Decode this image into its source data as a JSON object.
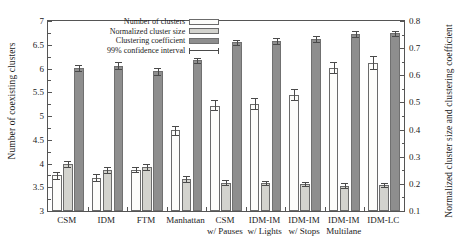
{
  "chart_data": {
    "type": "bar",
    "title": "",
    "subtitle": "",
    "xlabel": "",
    "ylabel": "Number of coexisting clusters",
    "y2label": "Normalized cluster size and clustering coefficient",
    "ylim": [
      3,
      7
    ],
    "y2lim": [
      0.1,
      0.8
    ],
    "ytick_step": 0.5,
    "y2tick_step": 0.1,
    "grid": false,
    "legend_position": "top-center",
    "categories": [
      "CSM",
      "IDM",
      "FTM",
      "Manhattan",
      "CSM w/ Pauses",
      "IDM-IM w/ Lights",
      "IDM-IM w/ Stops",
      "IDM-IM Multilane",
      "IDM-LC"
    ],
    "category_lines": [
      [
        "CSM",
        ""
      ],
      [
        "IDM",
        ""
      ],
      [
        "FTM",
        ""
      ],
      [
        "Manhattan",
        ""
      ],
      [
        "CSM",
        "w/ Pauses"
      ],
      [
        "IDM-IM",
        "w/ Lights"
      ],
      [
        "IDM-IM",
        "w/ Stops"
      ],
      [
        "IDM-IM",
        "Multilane"
      ],
      [
        "IDM-LC",
        ""
      ]
    ],
    "series": [
      {
        "name": "Number of clusters",
        "axis": "left",
        "color": "#fdfdfb",
        "values": [
          3.75,
          3.7,
          3.87,
          4.7,
          5.22,
          5.25,
          5.45,
          6.02,
          6.12
        ],
        "err_low": [
          3.68,
          3.64,
          3.82,
          4.6,
          5.12,
          5.14,
          5.33,
          5.9,
          5.98
        ],
        "err_high": [
          3.83,
          3.77,
          3.93,
          4.8,
          5.33,
          5.37,
          5.57,
          6.14,
          6.26
        ]
      },
      {
        "name": "Normalized cluster size",
        "axis": "right",
        "color": "#d3d3ce",
        "values": [
          3.99,
          3.86,
          3.92,
          3.68,
          3.6,
          3.59,
          3.57,
          3.53,
          3.55
        ],
        "err_low": [
          3.92,
          3.79,
          3.86,
          3.62,
          3.55,
          3.54,
          3.52,
          3.48,
          3.5
        ],
        "err_high": [
          4.06,
          3.93,
          3.98,
          3.74,
          3.65,
          3.64,
          3.62,
          3.58,
          3.6
        ]
      },
      {
        "name": "Clustering coefficient",
        "axis": "right",
        "color": "#8e8e8e",
        "values": [
          6.01,
          6.06,
          5.94,
          6.17,
          6.55,
          6.58,
          6.62,
          6.72,
          6.74
        ],
        "err_low": [
          5.94,
          5.98,
          5.86,
          6.11,
          6.49,
          6.52,
          6.56,
          6.66,
          6.68
        ],
        "err_high": [
          6.08,
          6.14,
          6.02,
          6.23,
          6.61,
          6.64,
          6.68,
          6.78,
          6.8
        ]
      }
    ],
    "legend": [
      {
        "label": "Number of clusters",
        "swatch": "s1"
      },
      {
        "label": "Normalized cluster size",
        "swatch": "s2"
      },
      {
        "label": "Clustering coefficient",
        "swatch": "s3"
      },
      {
        "label": "99% confidence interval",
        "swatch": "ci"
      }
    ],
    "y_ticks": [
      "3",
      "3.5",
      "4",
      "4.5",
      "5",
      "5.5",
      "6",
      "6.5",
      "7"
    ],
    "y2_ticks": [
      "0.1",
      "0.2",
      "0.3",
      "0.4",
      "0.5",
      "0.6",
      "0.7",
      "0.8"
    ]
  }
}
